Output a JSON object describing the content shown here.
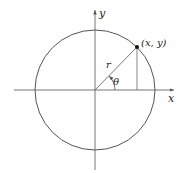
{
  "diagram": {
    "type": "unit-circle-polar-coordinates",
    "axis_labels": {
      "x": "x",
      "y": "y"
    },
    "point_label": "(x, y)",
    "radius_label": "r",
    "angle_label": "θ",
    "colors": {
      "stroke": "#555555",
      "text": "#222222",
      "point": "#111111"
    }
  }
}
